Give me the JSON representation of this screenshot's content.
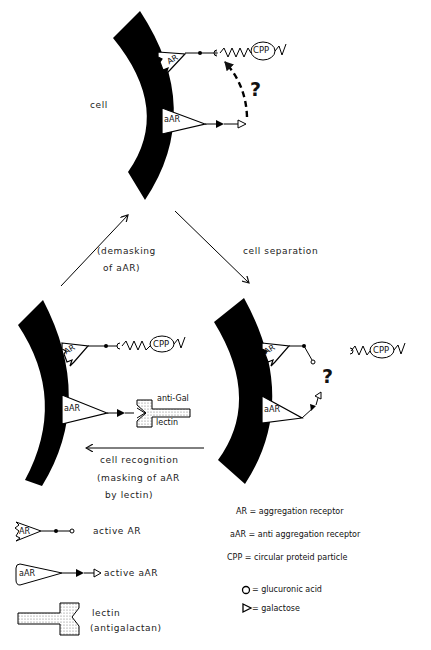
{
  "diagram": {
    "top_panel": {
      "cell_label": "cell",
      "receptor_ar": "AR",
      "receptor_aar": "aAR",
      "particle": "CPP",
      "question": "?"
    },
    "transitions": {
      "left_arrow_label_line1": "(demasking",
      "left_arrow_label_line2": "of aAR)",
      "right_arrow_label": "cell separation",
      "bottom_arrow_label_line1": "cell recognition",
      "bottom_arrow_label_line2": "(masking of aAR",
      "bottom_arrow_label_line3": "by lectin)"
    },
    "bottom_left_panel": {
      "receptor_ar": "AR",
      "receptor_aar": "aAR",
      "particle": "CPP",
      "lectin_top": "anti-Gal",
      "lectin_bottom": "lectin"
    },
    "bottom_right_panel": {
      "receptor_ar": "AR",
      "receptor_aar": "aAR",
      "particle": "CPP",
      "question": "?"
    },
    "legend_left": [
      {
        "symbol": "AR",
        "label": "active AR"
      },
      {
        "symbol": "aAR",
        "label": "active aAR"
      },
      {
        "symbol": "lectin-shape",
        "label": "lectin",
        "label2": "(antigalactan)"
      }
    ],
    "legend_right": [
      {
        "text": "AR = aggregation receptor"
      },
      {
        "text": "aAR = anti aggregation receptor"
      },
      {
        "text": "CPP = circular proteid particle"
      },
      {
        "text": "O = glucuronic acid"
      },
      {
        "text": "▷ = galactose"
      }
    ]
  }
}
